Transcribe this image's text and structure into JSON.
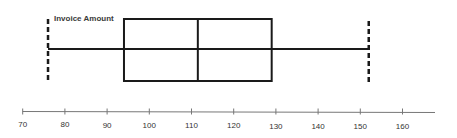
{
  "chart_data": {
    "type": "box",
    "title": "Invoice Amount",
    "xlabel": "",
    "ylabel": "",
    "orientation": "horizontal",
    "series": [
      {
        "name": "Invoice Amount",
        "min": 76,
        "q1": 94,
        "median": 111.5,
        "q3": 129,
        "max": 152
      }
    ],
    "x_ticks": [
      70,
      80,
      90,
      100,
      110,
      120,
      130,
      140,
      150,
      160
    ],
    "xlim": [
      70,
      168
    ],
    "grid": false,
    "legend": "none",
    "whisker_style": "dashed end caps"
  },
  "axis": {
    "tick_labels": [
      "70",
      "80",
      "90",
      "100",
      "110",
      "120",
      "130",
      "140",
      "150",
      "160"
    ]
  },
  "colors": {
    "box": "#1a1a1a",
    "axis": "#777777",
    "text": "#333333"
  }
}
